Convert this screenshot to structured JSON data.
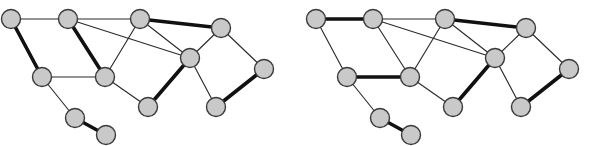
{
  "figure": {
    "title": "",
    "background_color": "#ffffff",
    "panel_count": 2,
    "node_fill": "#c9c9c9",
    "node_stroke": "#3a3a3a",
    "edge_thin_color": "#2b2b2b",
    "edge_bold_color": "#111111",
    "node_radius": 9.5,
    "thin_width": 1.15,
    "bold_width": 3.6
  },
  "chart_data": {
    "type": "diagram",
    "subtype": "graph-node-link",
    "title": "",
    "xlabel": "",
    "ylabel": "",
    "grid": false,
    "legend": [],
    "xlim": [
      0,
      610
    ],
    "ylim": [
      0,
      146
    ],
    "panels": [
      {
        "name": "left-graph",
        "label": "",
        "origin_x": 0,
        "nodes": [
          {
            "id": "n1",
            "x": 11,
            "y": 19
          },
          {
            "id": "n2",
            "x": 68,
            "y": 19
          },
          {
            "id": "n3",
            "x": 140,
            "y": 19
          },
          {
            "id": "n4",
            "x": 221,
            "y": 28
          },
          {
            "id": "n5",
            "x": 190,
            "y": 58
          },
          {
            "id": "n6",
            "x": 264,
            "y": 69
          },
          {
            "id": "n7",
            "x": 42,
            "y": 77
          },
          {
            "id": "n8",
            "x": 105,
            "y": 77
          },
          {
            "id": "n9",
            "x": 148,
            "y": 107
          },
          {
            "id": "n10",
            "x": 216,
            "y": 107
          },
          {
            "id": "n11",
            "x": 75,
            "y": 118
          },
          {
            "id": "n12",
            "x": 106,
            "y": 135
          }
        ],
        "edges": [
          {
            "from": "n1",
            "to": "n2",
            "weight": "thin"
          },
          {
            "from": "n2",
            "to": "n3",
            "weight": "thin"
          },
          {
            "from": "n3",
            "to": "n4",
            "weight": "bold"
          },
          {
            "from": "n1",
            "to": "n7",
            "weight": "bold"
          },
          {
            "from": "n2",
            "to": "n8",
            "weight": "bold"
          },
          {
            "from": "n2",
            "to": "n5",
            "weight": "thin"
          },
          {
            "from": "n3",
            "to": "n8",
            "weight": "thin"
          },
          {
            "from": "n3",
            "to": "n5",
            "weight": "thin"
          },
          {
            "from": "n4",
            "to": "n5",
            "weight": "thin"
          },
          {
            "from": "n4",
            "to": "n6",
            "weight": "thin"
          },
          {
            "from": "n7",
            "to": "n8",
            "weight": "thin"
          },
          {
            "from": "n8",
            "to": "n9",
            "weight": "thin"
          },
          {
            "from": "n5",
            "to": "n9",
            "weight": "bold"
          },
          {
            "from": "n5",
            "to": "n10",
            "weight": "thin"
          },
          {
            "from": "n6",
            "to": "n10",
            "weight": "bold"
          },
          {
            "from": "n7",
            "to": "n11",
            "weight": "thin"
          },
          {
            "from": "n11",
            "to": "n12",
            "weight": "bold"
          }
        ]
      },
      {
        "name": "right-graph",
        "label": "",
        "origin_x": 305,
        "nodes": [
          {
            "id": "n1",
            "x": 11,
            "y": 19
          },
          {
            "id": "n2",
            "x": 68,
            "y": 19
          },
          {
            "id": "n3",
            "x": 140,
            "y": 19
          },
          {
            "id": "n4",
            "x": 221,
            "y": 28
          },
          {
            "id": "n5",
            "x": 190,
            "y": 58
          },
          {
            "id": "n6",
            "x": 264,
            "y": 69
          },
          {
            "id": "n7",
            "x": 42,
            "y": 77
          },
          {
            "id": "n8",
            "x": 105,
            "y": 77
          },
          {
            "id": "n9",
            "x": 148,
            "y": 107
          },
          {
            "id": "n10",
            "x": 216,
            "y": 107
          },
          {
            "id": "n11",
            "x": 75,
            "y": 118
          },
          {
            "id": "n12",
            "x": 106,
            "y": 135
          }
        ],
        "edges": [
          {
            "from": "n1",
            "to": "n2",
            "weight": "bold"
          },
          {
            "from": "n2",
            "to": "n3",
            "weight": "thin"
          },
          {
            "from": "n3",
            "to": "n4",
            "weight": "bold"
          },
          {
            "from": "n1",
            "to": "n7",
            "weight": "thin"
          },
          {
            "from": "n2",
            "to": "n8",
            "weight": "thin"
          },
          {
            "from": "n2",
            "to": "n5",
            "weight": "thin"
          },
          {
            "from": "n3",
            "to": "n8",
            "weight": "thin"
          },
          {
            "from": "n3",
            "to": "n5",
            "weight": "thin"
          },
          {
            "from": "n4",
            "to": "n5",
            "weight": "thin"
          },
          {
            "from": "n4",
            "to": "n6",
            "weight": "thin"
          },
          {
            "from": "n7",
            "to": "n8",
            "weight": "bold"
          },
          {
            "from": "n8",
            "to": "n9",
            "weight": "thin"
          },
          {
            "from": "n5",
            "to": "n9",
            "weight": "bold"
          },
          {
            "from": "n5",
            "to": "n10",
            "weight": "thin"
          },
          {
            "from": "n6",
            "to": "n10",
            "weight": "bold"
          },
          {
            "from": "n7",
            "to": "n11",
            "weight": "thin"
          },
          {
            "from": "n11",
            "to": "n12",
            "weight": "bold"
          }
        ]
      }
    ]
  }
}
